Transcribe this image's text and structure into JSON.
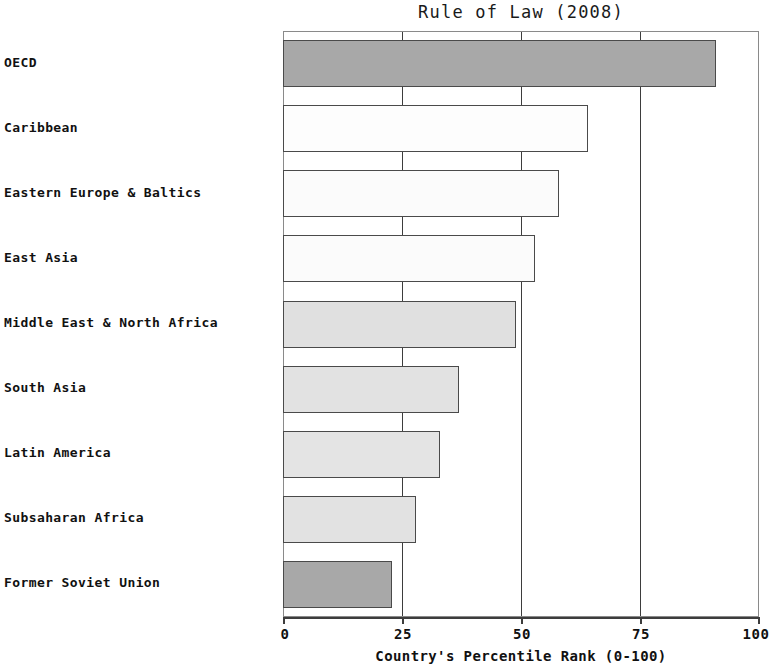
{
  "chart_data": {
    "type": "bar",
    "orientation": "horizontal",
    "title": "Rule of Law (2008)",
    "xlabel": "Country's Percentile Rank (0-100)",
    "ylabel": "",
    "xlim": [
      0,
      100
    ],
    "xticks": [
      0,
      25,
      50,
      75,
      100
    ],
    "xtick_labels": [
      "0",
      "25",
      "50",
      "75",
      "100"
    ],
    "grid": true,
    "legend": "none",
    "categories": [
      "OECD",
      "Caribbean",
      "Eastern Europe & Baltics",
      "East Asia",
      "Middle East & North Africa",
      "South Asia",
      "Latin America",
      "Subsaharan Africa",
      "Former Soviet Union"
    ],
    "values": [
      91,
      64,
      58,
      53,
      49,
      37,
      33,
      28,
      23
    ],
    "bar_colors": [
      "#a8a8a8",
      "#fdfdfd",
      "#fbfbfb",
      "#fbfbfb",
      "#e0e0e0",
      "#e2e2e2",
      "#e4e4e4",
      "#e2e2e2",
      "#a8a8a8"
    ],
    "bar_edge_color": "#4a4a4a",
    "axis_color": "#3d3d3d"
  },
  "bleed": {
    "line1": "suppose the before",
    "line2": "violating under investing",
    "line3": "under student structure"
  }
}
